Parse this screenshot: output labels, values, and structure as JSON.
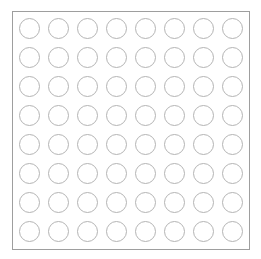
{
  "figure": {
    "type": "grid-matrix",
    "title": "",
    "canvas": {
      "width": 261,
      "height": 259,
      "background_color": "#ffffff"
    },
    "frame": {
      "shape": "rectangle",
      "x": 12,
      "y": 11,
      "width": 238,
      "height": 239,
      "stroke_color": "#9e9e9e",
      "stroke_width": 1,
      "fill_color": "#ffffff"
    },
    "grid": {
      "rows": 8,
      "columns": 8,
      "cell_count": 64,
      "pitch_x": 29,
      "pitch_y": 29,
      "inset_x": 6,
      "inset_y": 6
    },
    "cell": {
      "shape": "circle",
      "diameter": 21,
      "stroke_color": "#b4b4b4",
      "stroke_width": 1,
      "fill": "none",
      "state": "empty"
    },
    "cells": [
      {
        "row": 1,
        "col": 1,
        "label": ""
      },
      {
        "row": 1,
        "col": 2,
        "label": ""
      },
      {
        "row": 1,
        "col": 3,
        "label": ""
      },
      {
        "row": 1,
        "col": 4,
        "label": ""
      },
      {
        "row": 1,
        "col": 5,
        "label": ""
      },
      {
        "row": 1,
        "col": 6,
        "label": ""
      },
      {
        "row": 1,
        "col": 7,
        "label": ""
      },
      {
        "row": 1,
        "col": 8,
        "label": ""
      },
      {
        "row": 2,
        "col": 1,
        "label": ""
      },
      {
        "row": 2,
        "col": 2,
        "label": ""
      },
      {
        "row": 2,
        "col": 3,
        "label": ""
      },
      {
        "row": 2,
        "col": 4,
        "label": ""
      },
      {
        "row": 2,
        "col": 5,
        "label": ""
      },
      {
        "row": 2,
        "col": 6,
        "label": ""
      },
      {
        "row": 2,
        "col": 7,
        "label": ""
      },
      {
        "row": 2,
        "col": 8,
        "label": ""
      },
      {
        "row": 3,
        "col": 1,
        "label": ""
      },
      {
        "row": 3,
        "col": 2,
        "label": ""
      },
      {
        "row": 3,
        "col": 3,
        "label": ""
      },
      {
        "row": 3,
        "col": 4,
        "label": ""
      },
      {
        "row": 3,
        "col": 5,
        "label": ""
      },
      {
        "row": 3,
        "col": 6,
        "label": ""
      },
      {
        "row": 3,
        "col": 7,
        "label": ""
      },
      {
        "row": 3,
        "col": 8,
        "label": ""
      },
      {
        "row": 4,
        "col": 1,
        "label": ""
      },
      {
        "row": 4,
        "col": 2,
        "label": ""
      },
      {
        "row": 4,
        "col": 3,
        "label": ""
      },
      {
        "row": 4,
        "col": 4,
        "label": ""
      },
      {
        "row": 4,
        "col": 5,
        "label": ""
      },
      {
        "row": 4,
        "col": 6,
        "label": ""
      },
      {
        "row": 4,
        "col": 7,
        "label": ""
      },
      {
        "row": 4,
        "col": 8,
        "label": ""
      },
      {
        "row": 5,
        "col": 1,
        "label": ""
      },
      {
        "row": 5,
        "col": 2,
        "label": ""
      },
      {
        "row": 5,
        "col": 3,
        "label": ""
      },
      {
        "row": 5,
        "col": 4,
        "label": ""
      },
      {
        "row": 5,
        "col": 5,
        "label": ""
      },
      {
        "row": 5,
        "col": 6,
        "label": ""
      },
      {
        "row": 5,
        "col": 7,
        "label": ""
      },
      {
        "row": 5,
        "col": 8,
        "label": ""
      },
      {
        "row": 6,
        "col": 1,
        "label": ""
      },
      {
        "row": 6,
        "col": 2,
        "label": ""
      },
      {
        "row": 6,
        "col": 3,
        "label": ""
      },
      {
        "row": 6,
        "col": 4,
        "label": ""
      },
      {
        "row": 6,
        "col": 5,
        "label": ""
      },
      {
        "row": 6,
        "col": 6,
        "label": ""
      },
      {
        "row": 6,
        "col": 7,
        "label": ""
      },
      {
        "row": 6,
        "col": 8,
        "label": ""
      },
      {
        "row": 7,
        "col": 1,
        "label": ""
      },
      {
        "row": 7,
        "col": 2,
        "label": ""
      },
      {
        "row": 7,
        "col": 3,
        "label": ""
      },
      {
        "row": 7,
        "col": 4,
        "label": ""
      },
      {
        "row": 7,
        "col": 5,
        "label": ""
      },
      {
        "row": 7,
        "col": 6,
        "label": ""
      },
      {
        "row": 7,
        "col": 7,
        "label": ""
      },
      {
        "row": 7,
        "col": 8,
        "label": ""
      },
      {
        "row": 8,
        "col": 1,
        "label": ""
      },
      {
        "row": 8,
        "col": 2,
        "label": ""
      },
      {
        "row": 8,
        "col": 3,
        "label": ""
      },
      {
        "row": 8,
        "col": 4,
        "label": ""
      },
      {
        "row": 8,
        "col": 5,
        "label": ""
      },
      {
        "row": 8,
        "col": 6,
        "label": ""
      },
      {
        "row": 8,
        "col": 7,
        "label": ""
      },
      {
        "row": 8,
        "col": 8,
        "label": ""
      }
    ]
  }
}
